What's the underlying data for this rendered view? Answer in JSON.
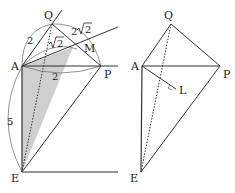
{
  "left_figure": {
    "points": {
      "A": "A",
      "Q": "Q",
      "P": "P",
      "M": "M",
      "E": "E"
    },
    "lengths": {
      "AQ": "2",
      "QM": "2",
      "AM_sqrt": "2",
      "MP_sqrt": "2",
      "MP_coef": "2",
      "AP": "2",
      "AE": "5"
    },
    "shading_color": "#c8c8c8"
  },
  "right_figure": {
    "points": {
      "A": "A",
      "Q": "Q",
      "P": "P",
      "L": "L",
      "E": "E"
    }
  }
}
